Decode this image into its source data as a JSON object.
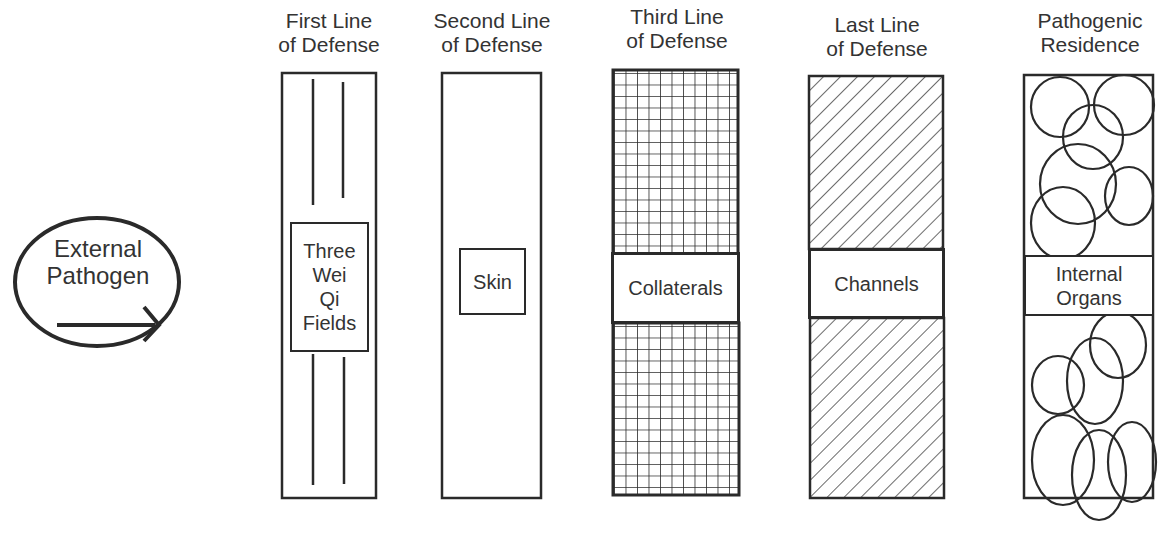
{
  "diagram": {
    "source": {
      "label_lines": [
        "External",
        "Pathogen"
      ],
      "arrow": "arrow-right-icon"
    },
    "columns": [
      {
        "id": "first",
        "heading_lines": [
          "First Line",
          "of Defense"
        ],
        "label_lines": [
          "Three",
          "Wei",
          "Qi",
          "Fields"
        ],
        "pattern": "vertical-lines"
      },
      {
        "id": "second",
        "heading_lines": [
          "Second Line",
          "of Defense"
        ],
        "label_lines": [
          "Skin"
        ],
        "pattern": "plain"
      },
      {
        "id": "third",
        "heading_lines": [
          "Third Line",
          "of Defense"
        ],
        "label_lines": [
          "Collaterals"
        ],
        "pattern": "grid"
      },
      {
        "id": "last",
        "heading_lines": [
          "Last Line",
          "of Defense"
        ],
        "label_lines": [
          "Channels"
        ],
        "pattern": "diagonal-hatch"
      },
      {
        "id": "residence",
        "heading_lines": [
          "Pathogenic",
          "Residence"
        ],
        "label_lines": [
          "Internal",
          "Organs"
        ],
        "pattern": "circles"
      }
    ],
    "colors": {
      "stroke": "#2a2a2a",
      "text": "#333333",
      "background": "#ffffff"
    }
  }
}
